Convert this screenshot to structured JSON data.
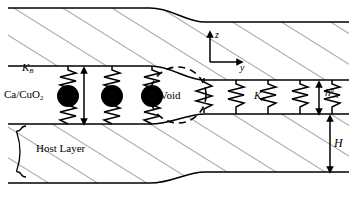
{
  "figure": {
    "type": "schematic-cross-section",
    "background_color": "#ffffff",
    "line_color": "#000000",
    "hatch_color": "#555555",
    "atom_color": "#000000"
  },
  "labels": {
    "spring_constant_b": "K",
    "spring_constant_b_sub": "B",
    "spring_constant_a": "K",
    "spring_constant_a_sub": "A",
    "material": "Ca/CuO",
    "material_sub": "2",
    "height_b": "h",
    "height_b_sup": "0",
    "height_b_sub": "B",
    "height_a": "h",
    "height_a_sup": "0",
    "height_a_sub": "A",
    "void": "Void",
    "host_layer": "Host Layer",
    "total_height": "H",
    "axis_z": "z",
    "axis_y": "y"
  },
  "geometry": {
    "top_layer_left_top": 8,
    "top_layer_left_bottom": 66,
    "top_layer_right_top": 22,
    "top_layer_right_bottom": 80,
    "gap_left_bottom": 124,
    "gap_right_bottom": 114,
    "host_left_bottom": 183,
    "host_right_bottom": 172,
    "step_x_start": 150,
    "step_x_end": 205,
    "void_center_x": 178,
    "void_center_y": 95,
    "void_radius": 28
  },
  "atoms": [
    {
      "cx": 68,
      "cy": 96,
      "r": 11
    },
    {
      "cx": 112,
      "cy": 96,
      "r": 11
    },
    {
      "cx": 152,
      "cy": 96,
      "r": 11
    }
  ],
  "springs_b": [
    {
      "x": 72,
      "label": "K_B"
    },
    {
      "x": 114,
      "label": ""
    },
    {
      "x": 154,
      "label": ""
    }
  ],
  "springs_a": [
    {
      "x": 214
    },
    {
      "x": 245
    },
    {
      "x": 278
    },
    {
      "x": 310
    }
  ],
  "dimensions": [
    {
      "name": "h_B_0",
      "x": 84,
      "y_top": 68,
      "y_bottom": 126
    },
    {
      "name": "h_A_0",
      "x": 319,
      "y_top": 82,
      "y_bottom": 116
    },
    {
      "name": "H",
      "x": 330,
      "y_top": 118,
      "y_bottom": 174
    }
  ],
  "axes": {
    "origin_x": 210,
    "origin_y": 62,
    "z_tip_y": 31,
    "y_tip_x": 243
  }
}
